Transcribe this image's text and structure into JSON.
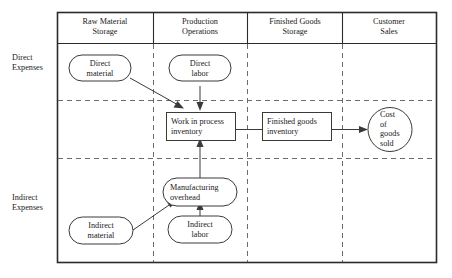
{
  "diagram": {
    "column_headers": [
      {
        "id": "raw-material-storage",
        "line1": "Raw Material",
        "line2": "Storage"
      },
      {
        "id": "production-operations",
        "line1": "Production",
        "line2": "Operations"
      },
      {
        "id": "finished-goods-storage",
        "line1": "Finished Goods",
        "line2": "Storage"
      },
      {
        "id": "customer-sales",
        "line1": "Customer",
        "line2": "Sales"
      }
    ],
    "row_labels": [
      {
        "id": "direct-expenses",
        "line1": "Direct",
        "line2": "Expenses"
      },
      {
        "id": "indirect-expenses",
        "line1": "Indirect",
        "line2": "Expenses"
      }
    ],
    "nodes": [
      {
        "id": "direct-material",
        "shape": "rounded",
        "line1": "Direct",
        "line2": "material"
      },
      {
        "id": "direct-labor",
        "shape": "rounded",
        "line1": "Direct",
        "line2": "labor"
      },
      {
        "id": "work-in-process-inventory",
        "shape": "rect",
        "line1": "Work in process",
        "line2": "inventory"
      },
      {
        "id": "finished-goods-inventory",
        "shape": "rect",
        "line1": "Finished goods",
        "line2": "inventory"
      },
      {
        "id": "cost-of-goods-sold",
        "shape": "circle",
        "line1": "Cost",
        "line2": "of",
        "line3": "goods",
        "line4": "sold"
      },
      {
        "id": "manufacturing-overhead",
        "shape": "rounded",
        "line1": "Manufacturing",
        "line2": "overhead"
      },
      {
        "id": "indirect-material",
        "shape": "rounded",
        "line1": "Indirect",
        "line2": "material"
      },
      {
        "id": "indirect-labor",
        "shape": "rounded",
        "line1": "Indirect",
        "line2": "labor"
      }
    ],
    "edges": [
      {
        "id": "direct-material-to-wip",
        "from": "direct-material",
        "to": "work-in-process-inventory"
      },
      {
        "id": "direct-labor-to-wip",
        "from": "direct-labor",
        "to": "work-in-process-inventory"
      },
      {
        "id": "overhead-to-wip",
        "from": "manufacturing-overhead",
        "to": "work-in-process-inventory"
      },
      {
        "id": "indirect-material-to-overhead",
        "from": "indirect-material",
        "to": "manufacturing-overhead"
      },
      {
        "id": "indirect-labor-to-overhead",
        "from": "indirect-labor",
        "to": "manufacturing-overhead"
      },
      {
        "id": "wip-to-finished-goods",
        "from": "work-in-process-inventory",
        "to": "finished-goods-inventory"
      },
      {
        "id": "finished-goods-to-cogs",
        "from": "finished-goods-inventory",
        "to": "cost-of-goods-sold"
      }
    ],
    "colors": {
      "background": "#ffffff",
      "frame": "#2b2b2b",
      "divider": "#6b6b6b",
      "shape_stroke": "#3a3a3a",
      "text": "#1a1a1a"
    }
  }
}
